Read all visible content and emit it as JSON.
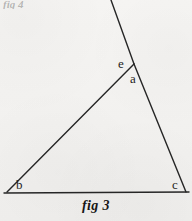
{
  "figure": {
    "caption": "fig 3",
    "top_cut_text": "fig 4",
    "background_color": "#f4f3f1",
    "ink_color": "#262626",
    "labels": {
      "apex_exterior": "e",
      "apex_interior": "a",
      "bottom_left": "b",
      "bottom_right": "c"
    },
    "geometry": {
      "type": "triangle-with-extended-side",
      "vertices": {
        "a": {
          "x": 134,
          "y": 64
        },
        "b": {
          "x": 7,
          "y": 192
        },
        "c": {
          "x": 186,
          "y": 192
        }
      },
      "extension_endpoint": {
        "x": 111,
        "y": 0
      },
      "segments": [
        {
          "name": "side-ab",
          "from": "b",
          "to": "a"
        },
        {
          "name": "side-ac",
          "from": "a",
          "to": "c"
        },
        {
          "name": "base-bc",
          "from": "b",
          "to": "c"
        },
        {
          "name": "extension-past-a",
          "from": "a",
          "to": "extension_endpoint"
        }
      ],
      "stroke_width": 1.4
    }
  }
}
